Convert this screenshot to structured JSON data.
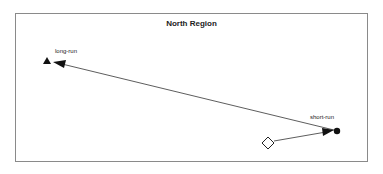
{
  "diagram": {
    "title": "North Region",
    "labels": {
      "long_run": "long-run",
      "short_run": "short-run"
    },
    "nodes": [
      {
        "id": "origin",
        "shape": "diamond",
        "fill": "none",
        "x": 268,
        "y": 143
      },
      {
        "id": "short-run",
        "shape": "circle",
        "fill": "#111111",
        "x": 337,
        "y": 131
      },
      {
        "id": "long-run",
        "shape": "triangle",
        "fill": "#111111",
        "x": 47,
        "y": 61
      }
    ],
    "edges": [
      {
        "from": "origin",
        "to": "short-run"
      },
      {
        "from": "short-run",
        "to": "long-run"
      }
    ],
    "colors": {
      "stroke": "#333333",
      "frame": "#8a8a8a"
    }
  }
}
